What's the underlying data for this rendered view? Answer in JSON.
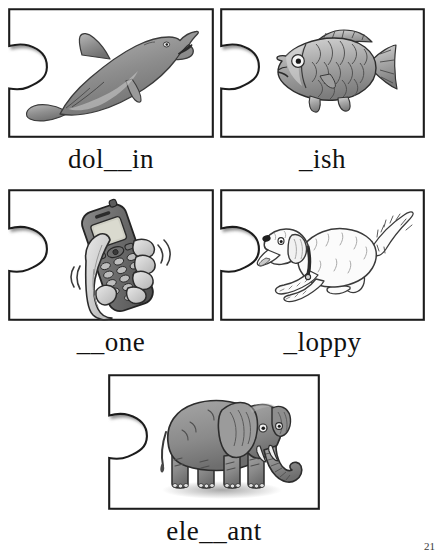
{
  "worksheet": {
    "title": "Phonics puzzle worksheet - missing letters",
    "page_number": "21",
    "card_fill": "#ffffff",
    "card_border": "#1a1a1a",
    "ink": "#111111",
    "art_gray": "#8c8c8c"
  },
  "cards": [
    {
      "id": "dolphin",
      "label": "dol__in",
      "word": "dolphin",
      "missing": "ph",
      "icon": "dolphin-illustration",
      "row": 1,
      "column": 1
    },
    {
      "id": "fish",
      "label": "_ish",
      "word": "fish",
      "missing": "f",
      "icon": "fish-illustration",
      "row": 1,
      "column": 2
    },
    {
      "id": "phone",
      "label": "__one",
      "word": "phone",
      "missing": "ph",
      "icon": "phone-in-hand-illustration",
      "row": 2,
      "column": 1
    },
    {
      "id": "floppy",
      "label": "_loppy",
      "word": "floppy",
      "missing": "f",
      "icon": "running-dog-illustration",
      "row": 2,
      "column": 2
    },
    {
      "id": "elephant",
      "label": "ele__ant",
      "word": "elephant",
      "missing": "ph",
      "icon": "elephant-illustration",
      "row": 3,
      "column": 1
    }
  ]
}
